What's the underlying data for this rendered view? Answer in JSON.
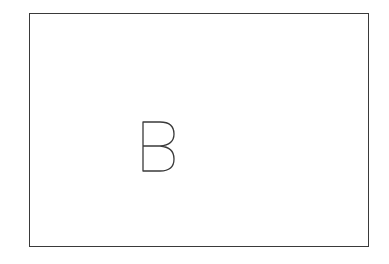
{
  "diagram": {
    "frame": {
      "border_color": "#3a3a3a"
    },
    "label": {
      "text": "B",
      "style": "outline"
    }
  }
}
